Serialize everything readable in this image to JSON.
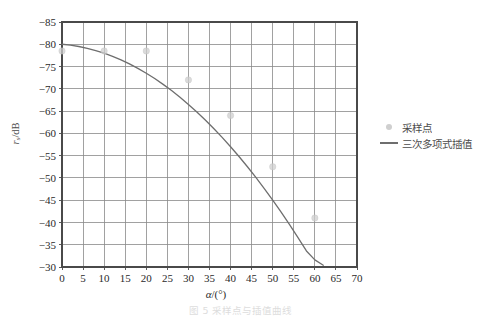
{
  "chart_data": {
    "type": "line",
    "title": "",
    "xlabel": "α /(°)",
    "ylabel": "r_s /dB",
    "xlim": [
      0,
      70
    ],
    "ylim": [
      -85,
      -30
    ],
    "y_inverted": true,
    "grid": true,
    "legend_position": "right",
    "x_ticks": [
      0,
      5,
      10,
      15,
      20,
      25,
      30,
      35,
      40,
      45,
      50,
      55,
      60,
      65,
      70
    ],
    "x_tick_labels": [
      "0",
      "5",
      "10",
      "15",
      "20",
      "25",
      "30",
      "35",
      "40",
      "45",
      "50",
      "55",
      "60",
      "65",
      "70"
    ],
    "y_ticks": [
      -85,
      -80,
      -75,
      -70,
      -65,
      -60,
      -55,
      -50,
      -45,
      -40,
      -35,
      -30
    ],
    "y_tick_labels": [
      "−85",
      "−80",
      "−75",
      "−70",
      "−65",
      "−60",
      "−55",
      "−50",
      "−45",
      "−40",
      "−35",
      "−30"
    ],
    "series": [
      {
        "name": "采样点",
        "type": "scatter",
        "marker": "circle",
        "color": "#cfcfcf",
        "x": [
          0,
          10,
          20,
          30,
          40,
          50,
          60
        ],
        "y": [
          -78.5,
          -78.5,
          -78.5,
          -72.0,
          -64.0,
          -52.5,
          -41.0
        ]
      },
      {
        "name": "三次多项式插值",
        "type": "line",
        "color": "#6e6e6e",
        "x": [
          0,
          2,
          4,
          6,
          8,
          10,
          12,
          14,
          16,
          18,
          20,
          22,
          24,
          26,
          28,
          30,
          32,
          34,
          36,
          38,
          40,
          42,
          44,
          46,
          48,
          50,
          52,
          54,
          56,
          58,
          60,
          62
        ],
        "y": [
          -80.0,
          -79.8,
          -79.5,
          -79.1,
          -78.6,
          -78.0,
          -77.3,
          -76.5,
          -75.6,
          -74.6,
          -73.5,
          -72.3,
          -71.0,
          -69.6,
          -68.1,
          -66.5,
          -64.8,
          -63.0,
          -61.1,
          -59.1,
          -57.0,
          -54.8,
          -52.5,
          -50.1,
          -47.6,
          -45.0,
          -42.3,
          -39.5,
          -36.6,
          -33.6,
          -31.6,
          -30.4
        ]
      }
    ]
  },
  "legend": {
    "items": [
      {
        "label": "采样点",
        "kind": "marker"
      },
      {
        "label": "三次多项式插值",
        "kind": "line"
      }
    ]
  },
  "axes": {
    "y_label_main": "r",
    "y_label_sub": "s",
    "y_label_unit": "/dB",
    "x_label_symbol": "α",
    "x_label_unit": "/(°)"
  },
  "caption": {
    "text": "图 5    采样点与插值曲线"
  },
  "colors": {
    "grid": "#8a8a8a",
    "frame": "#4a4a4a",
    "curve": "#6e6e6e",
    "marker": "#cfcfcf",
    "text": "#2a2a2a"
  }
}
